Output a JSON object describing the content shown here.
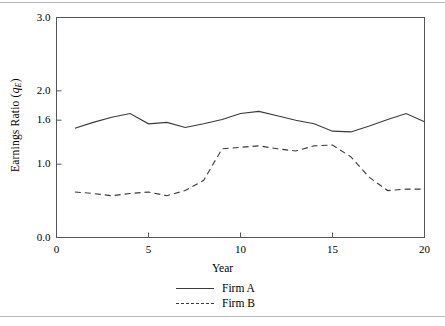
{
  "chart_data": {
    "type": "line",
    "title": "",
    "xlabel": "Year",
    "ylabel": "Earnings Ratio (qE)",
    "ylabel_text": "Earnings Ratio (",
    "ylabel_var": "q",
    "ylabel_sub": "E",
    "ylabel_close": ")",
    "xlim": [
      0,
      20
    ],
    "ylim": [
      0.0,
      3.0
    ],
    "xticks": [
      0,
      5,
      10,
      15,
      20
    ],
    "xtick_labels": [
      "0",
      "5",
      "10",
      "15",
      "20"
    ],
    "yticks": [
      0.0,
      1.0,
      1.6,
      2.0,
      3.0
    ],
    "ytick_labels": [
      "0.0",
      "1.0",
      "1.6",
      "2.0",
      "3.0"
    ],
    "grid": false,
    "legend_position": "below-axes-center",
    "x": [
      1,
      2,
      3,
      4,
      5,
      6,
      7,
      8,
      9,
      10,
      11,
      12,
      13,
      14,
      15,
      16,
      17,
      18,
      19,
      20
    ],
    "series": [
      {
        "name": "Firm A",
        "style": "solid",
        "color": "#3a3a3a",
        "values": [
          1.49,
          1.57,
          1.64,
          1.69,
          1.55,
          1.57,
          1.5,
          1.55,
          1.61,
          1.69,
          1.72,
          1.66,
          1.6,
          1.55,
          1.45,
          1.44,
          1.52,
          1.61,
          1.69,
          1.58
        ]
      },
      {
        "name": "Firm B",
        "style": "dashed",
        "color": "#3a3a3a",
        "values": [
          0.62,
          0.6,
          0.57,
          0.6,
          0.62,
          0.57,
          0.64,
          0.78,
          1.21,
          1.23,
          1.25,
          1.21,
          1.18,
          1.25,
          1.26,
          1.1,
          0.82,
          0.64,
          0.66,
          0.66
        ]
      }
    ]
  },
  "legend": {
    "items": [
      {
        "label": "Firm A",
        "style": "solid"
      },
      {
        "label": "Firm B",
        "style": "dashed"
      }
    ]
  }
}
